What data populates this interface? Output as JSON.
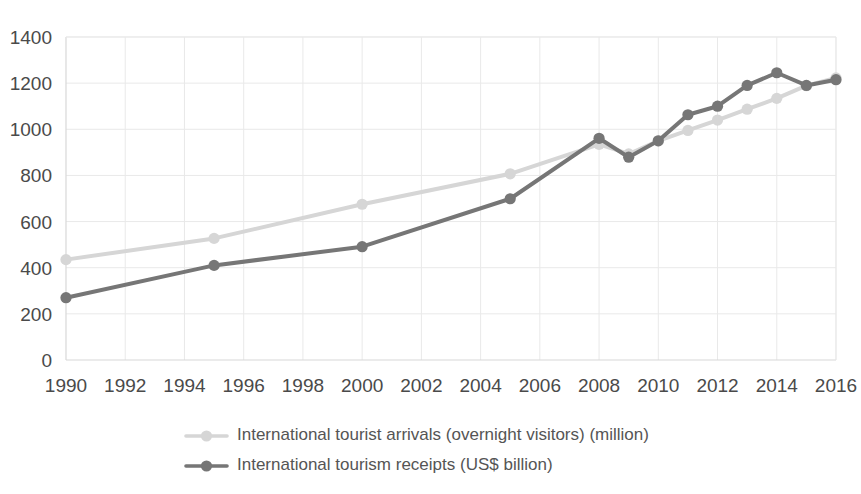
{
  "chart_data": {
    "type": "line",
    "title": "",
    "subtitle": "",
    "xlabel": "",
    "ylabel": "",
    "xlim": [
      1990,
      2016
    ],
    "ylim": [
      0,
      1400
    ],
    "grid": true,
    "legend_position": "bottom",
    "y_ticks": [
      0,
      200,
      400,
      600,
      800,
      1000,
      1200,
      1400
    ],
    "x_ticks": [
      1990,
      1992,
      1994,
      1996,
      1998,
      2000,
      2002,
      2004,
      2006,
      2008,
      2010,
      2012,
      2014,
      2016
    ],
    "series": [
      {
        "name": "International tourist arrivals (overnight visitors) (million)",
        "color": "#d6d6d6",
        "x": [
          1990,
          1995,
          2000,
          2005,
          2008,
          2009,
          2010,
          2011,
          2012,
          2013,
          2014,
          2015,
          2016
        ],
        "values": [
          435,
          527,
          675,
          807,
          935,
          893,
          950,
          995,
          1040,
          1087,
          1134,
          1189,
          1223
        ]
      },
      {
        "name": "International tourism receipts (US$ billion)",
        "color": "#767676",
        "x": [
          1990,
          1995,
          2000,
          2005,
          2008,
          2009,
          2010,
          2011,
          2012,
          2013,
          2014,
          2015,
          2016
        ],
        "values": [
          270,
          410,
          491,
          699,
          961,
          879,
          950,
          1063,
          1100,
          1190,
          1245,
          1190,
          1215
        ]
      }
    ]
  },
  "legend": {
    "items": [
      {
        "label": "International tourist arrivals (overnight visitors) (million)",
        "color": "#d6d6d6"
      },
      {
        "label": "International tourism receipts (US$ billion)",
        "color": "#767676"
      }
    ]
  },
  "axis": {
    "y_labels": [
      "1400",
      "1200",
      "1000",
      "800",
      "600",
      "400",
      "200",
      "0"
    ],
    "x_labels": [
      "1990",
      "1992",
      "1994",
      "1996",
      "1998",
      "2000",
      "2002",
      "2004",
      "2006",
      "2008",
      "2010",
      "2012",
      "2014",
      "2016"
    ]
  }
}
